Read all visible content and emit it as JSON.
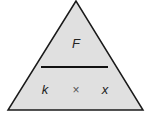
{
  "diagram": {
    "type": "formula-triangle",
    "top": "F",
    "bottom_left": "k",
    "operator": "×",
    "bottom_right": "x",
    "colors": {
      "fill": "#e0e0e0",
      "stroke": "#1a1a1a",
      "background": "#ffffff"
    }
  }
}
